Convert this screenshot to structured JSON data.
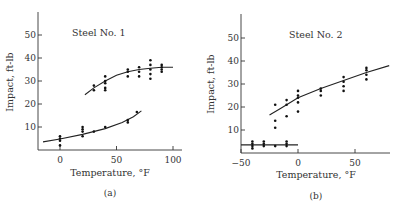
{
  "chart_data": [
    {
      "type": "scatter",
      "panel_label": "(a)",
      "title": "Steel No. 1",
      "xlabel": "Temperature, °F",
      "ylabel": "Impact, ft-lb",
      "xlim": [
        -15,
        105
      ],
      "ylim": [
        0,
        58
      ],
      "xticks": [
        0,
        50,
        100
      ],
      "yticks": [
        10,
        20,
        30,
        40,
        50
      ],
      "grid": false,
      "series": [
        {
          "name": "Upper (ductile) data",
          "points": [
            [
              30,
              26
            ],
            [
              30,
              28
            ],
            [
              40,
              26
            ],
            [
              40,
              27
            ],
            [
              40,
              29
            ],
            [
              40,
              30
            ],
            [
              40,
              32
            ],
            [
              60,
              32
            ],
            [
              60,
              34
            ],
            [
              60,
              35
            ],
            [
              70,
              32
            ],
            [
              70,
              34
            ],
            [
              70,
              36
            ],
            [
              80,
              31
            ],
            [
              80,
              33
            ],
            [
              80,
              35
            ],
            [
              80,
              37
            ],
            [
              80,
              39
            ],
            [
              90,
              34
            ],
            [
              90,
              35
            ],
            [
              90,
              36
            ],
            [
              90,
              37
            ]
          ],
          "fit_curve": [
            [
              22,
              24
            ],
            [
              30,
              27
            ],
            [
              40,
              30
            ],
            [
              50,
              32.5
            ],
            [
              60,
              34
            ],
            [
              70,
              35
            ],
            [
              80,
              35.5
            ],
            [
              90,
              36
            ],
            [
              100,
              36
            ]
          ]
        },
        {
          "name": "Lower (brittle) data",
          "points": [
            [
              0,
              2
            ],
            [
              0,
              4
            ],
            [
              0,
              5
            ],
            [
              0,
              6
            ],
            [
              20,
              6
            ],
            [
              20,
              8
            ],
            [
              20,
              9
            ],
            [
              20,
              10
            ],
            [
              30,
              8
            ],
            [
              40,
              10
            ],
            [
              60,
              12
            ],
            [
              60,
              13
            ],
            [
              68,
              16.5
            ]
          ],
          "fit_curve": [
            [
              -15,
              3.5
            ],
            [
              0,
              4.8
            ],
            [
              20,
              6.8
            ],
            [
              40,
              9.3
            ],
            [
              55,
              12
            ],
            [
              65,
              14.5
            ],
            [
              72,
              17
            ]
          ]
        }
      ]
    },
    {
      "type": "scatter",
      "panel_label": "(b)",
      "title": "Steel No. 2",
      "xlabel": "Temperature, °F",
      "ylabel": "Impact, ft-lb",
      "xlim": [
        -50,
        80
      ],
      "ylim": [
        0,
        58
      ],
      "xticks": [
        -50,
        0,
        50
      ],
      "yticks": [
        10,
        20,
        30,
        40,
        50
      ],
      "grid": false,
      "series": [
        {
          "name": "Upper (ductile) data",
          "points": [
            [
              -20,
              11
            ],
            [
              -20,
              14
            ],
            [
              -20,
              21
            ],
            [
              -10,
              16
            ],
            [
              -10,
              21
            ],
            [
              -10,
              23
            ],
            [
              0,
              18
            ],
            [
              0,
              22
            ],
            [
              0,
              24
            ],
            [
              0,
              25
            ],
            [
              0,
              27
            ],
            [
              20,
              25
            ],
            [
              20,
              27
            ],
            [
              20,
              28
            ],
            [
              40,
              27
            ],
            [
              40,
              29
            ],
            [
              40,
              31
            ],
            [
              40,
              33
            ],
            [
              60,
              32
            ],
            [
              60,
              34
            ],
            [
              60,
              36
            ],
            [
              60,
              37
            ]
          ],
          "fit_curve": [
            [
              -25,
              16.5
            ],
            [
              -15,
              19.5
            ],
            [
              0,
              24
            ],
            [
              20,
              28
            ],
            [
              40,
              31.5
            ],
            [
              60,
              35
            ],
            [
              80,
              38
            ]
          ]
        },
        {
          "name": "Lower (brittle) data",
          "points": [
            [
              -40,
              2
            ],
            [
              -40,
              3
            ],
            [
              -40,
              4
            ],
            [
              -40,
              5
            ],
            [
              -30,
              3
            ],
            [
              -30,
              4
            ],
            [
              -30,
              5
            ],
            [
              -20,
              3
            ],
            [
              -10,
              3
            ],
            [
              -10,
              4
            ],
            [
              -10,
              5
            ]
          ],
          "fit_curve": [
            [
              -50,
              3.5
            ],
            [
              -40,
              3.5
            ],
            [
              -30,
              3.5
            ],
            [
              -20,
              3.5
            ],
            [
              -10,
              3.5
            ],
            [
              0,
              3.5
            ]
          ]
        }
      ]
    }
  ]
}
